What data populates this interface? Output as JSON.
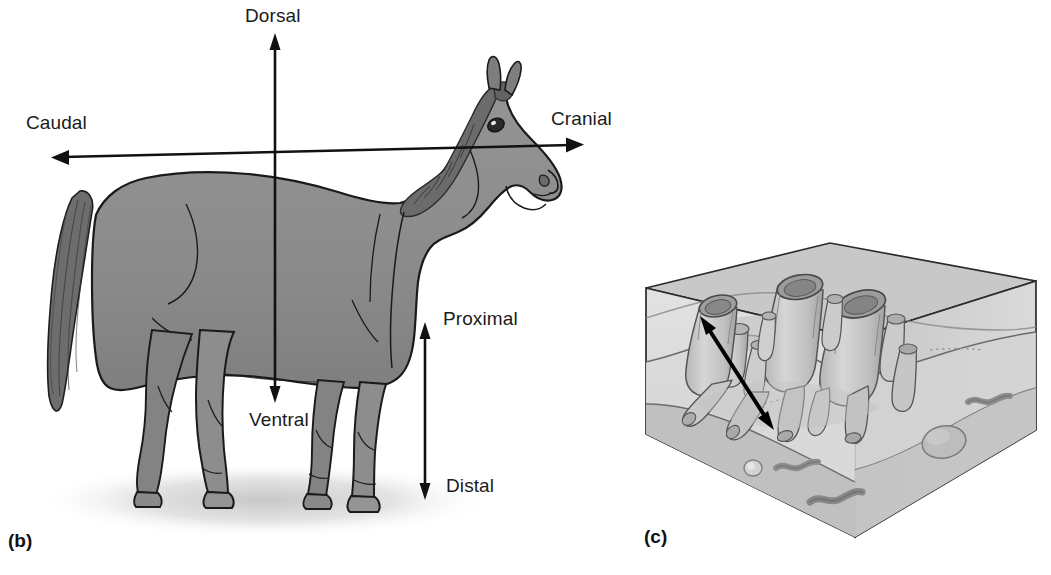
{
  "figure": {
    "background_color": "#ffffff"
  },
  "panels": [
    {
      "id": "b",
      "label": "(b)",
      "subject": "horse-lateral-view",
      "description": "Lateral view of a horse with directional axis arrows"
    },
    {
      "id": "c",
      "label": "(c)",
      "subject": "sediment-block-3d",
      "description": "Three-dimensional block of seafloor sediment with tube-dwelling organisms and a double-headed arrow"
    }
  ],
  "panel_b": {
    "panel_label": "(b)",
    "axis_labels": {
      "dorsal": "Dorsal",
      "ventral": "Ventral",
      "cranial": "Cranial",
      "caudal": "Caudal",
      "proximal": "Proximal",
      "distal": "Distal"
    },
    "arrows": [
      {
        "name": "dorsoventral-axis",
        "from": "Ventral",
        "to": "Dorsal",
        "orientation": "vertical",
        "heads": "both"
      },
      {
        "name": "craniocaudal-axis",
        "from": "Caudal",
        "to": "Cranial",
        "orientation": "horizontal",
        "heads": "both"
      },
      {
        "name": "proximodistal-axis",
        "from": "Distal",
        "to": "Proximal",
        "orientation": "vertical",
        "heads": "both"
      }
    ],
    "colors": {
      "body_fill": "#8d8d8d",
      "body_shadow": "#7a7a7a",
      "mane_tail": "#6a6a6a",
      "outline": "#1a1a1a",
      "ground_shadow": "#d8d8d8"
    }
  },
  "panel_c": {
    "panel_label": "(c)",
    "arrow": {
      "name": "orientation-arrow",
      "orientation": "diagonal",
      "heads": "both"
    },
    "elements": [
      "sediment-block",
      "tube-organisms",
      "worm-traces",
      "pebbles"
    ],
    "counts": {
      "large_tubes": 4,
      "small_tubes": 10,
      "worms": 3,
      "pebbles": 3
    },
    "colors": {
      "block_top": "#c9c9c9",
      "block_front": "#d5d5d5",
      "block_side": "#bcbcbc",
      "sediment_light": "#dedede",
      "sediment_dark": "#b4b4b4",
      "tube_fill": "#cfcfcf",
      "tube_shade": "#a8a8a8",
      "outline": "#4a4a4a",
      "edge": "#2b2b2b"
    }
  }
}
